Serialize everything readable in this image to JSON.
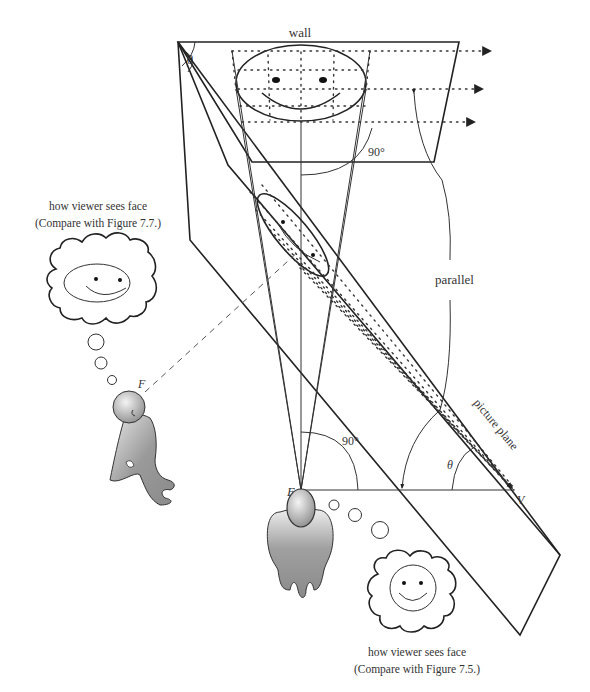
{
  "labels": {
    "wall": "wall",
    "theta_top": "θ",
    "angle_top": "90°",
    "parallel": "parallel",
    "picture_plane": "picture plane",
    "angle_bottom": "90°",
    "theta_bottom": "θ",
    "point_E": "E",
    "point_V": "V",
    "point_F": "F"
  },
  "captions": {
    "left": {
      "line1": "how viewer sees face",
      "line2": "(Compare with Figure 7.7.)"
    },
    "right": {
      "line1": "how viewer sees face",
      "line2": "(Compare with Figure 7.5.)"
    }
  },
  "colors": {
    "ink": "#222222",
    "figure_fill": "#9a9a9a",
    "head_fill": "#d8d8d8"
  }
}
